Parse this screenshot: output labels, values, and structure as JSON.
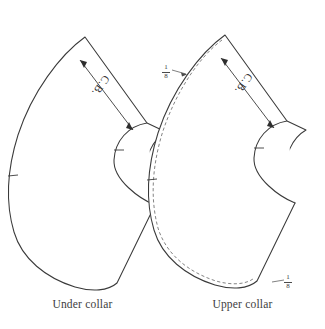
{
  "figure": {
    "type": "sewing-pattern-diagram",
    "background_color": "#ffffff",
    "line_color": "#3a3a3a",
    "pieces": [
      {
        "id": "under-collar",
        "caption": "Under collar",
        "grainline_label": "C.B.",
        "grainline_type": "double-arrow",
        "has_seam_allowance_line": false,
        "notches": 2,
        "annotations": []
      },
      {
        "id": "upper-collar",
        "caption": "Upper collar",
        "grainline_label": "C.B.",
        "grainline_type": "double-arrow",
        "has_seam_allowance_line": true,
        "seam_line_style": "dashed",
        "notches": 2,
        "annotations": [
          {
            "id": "frac-top",
            "numerator": "1",
            "denominator": "8",
            "text": "1/8"
          },
          {
            "id": "frac-bottom",
            "numerator": "1",
            "denominator": "8",
            "text": "1/8"
          }
        ]
      }
    ]
  },
  "captions": {
    "under": "Under collar",
    "upper": "Upper collar"
  },
  "grainlines": {
    "under_label": "C.B.",
    "upper_label": "C.B."
  },
  "fractions": {
    "top": {
      "numerator": "1",
      "denominator": "8"
    },
    "bottom": {
      "numerator": "1",
      "denominator": "8"
    }
  }
}
